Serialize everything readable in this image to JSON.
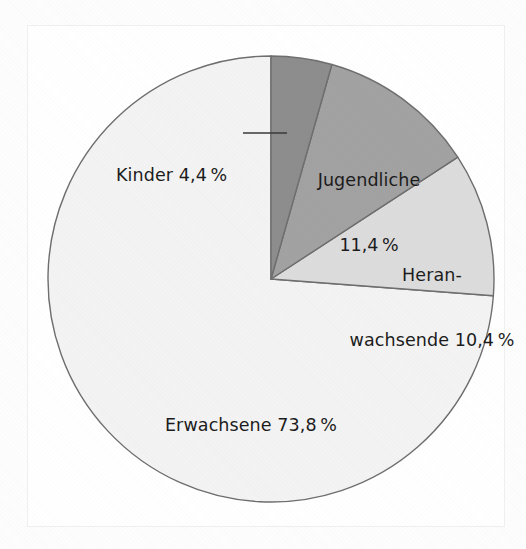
{
  "chart_data": {
    "type": "pie",
    "title": "",
    "subtitle": "",
    "xlabel": "",
    "ylabel": "",
    "legend_position": "none",
    "grid": false,
    "units": "percent",
    "decimal_separator": ",",
    "start_angle_deg": 0,
    "direction": "clockwise",
    "categories": [
      "Kinder",
      "Jugendliche",
      "Heranwachsende",
      "Erwachsene"
    ],
    "values": [
      4.4,
      11.4,
      10.4,
      73.8
    ],
    "colors": [
      "#8d8d8d",
      "#a2a2a2",
      "#dcdcdc",
      "#f3f3f3"
    ],
    "slices": [
      {
        "name": "Kinder",
        "value": 4.4,
        "value_text": "4,4 %",
        "label_text": "Kinder 4,4 %",
        "color": "#8d8d8d",
        "label_placement": "outside-left",
        "has_leader_line": true,
        "start_angle_deg": 0,
        "end_angle_deg": 15.84
      },
      {
        "name": "Jugendliche",
        "value": 11.4,
        "value_text": "11,4 %",
        "label_line1": "Jugendliche",
        "label_line2": "11,4 %",
        "color": "#a2a2a2",
        "label_placement": "inside",
        "has_leader_line": false,
        "start_angle_deg": 15.84,
        "end_angle_deg": 56.88
      },
      {
        "name": "Heranwachsende",
        "value": 10.4,
        "value_text": "10,4 %",
        "label_line1": "Heran-",
        "label_line2": "wachsende 10,4 %",
        "color": "#dcdcdc",
        "label_placement": "inside",
        "has_leader_line": false,
        "start_angle_deg": 56.88,
        "end_angle_deg": 94.32
      },
      {
        "name": "Erwachsene",
        "value": 73.8,
        "value_text": "73,8 %",
        "label_text": "Erwachsene 73,8 %",
        "color": "#f3f3f3",
        "label_placement": "inside",
        "has_leader_line": false,
        "start_angle_deg": 94.32,
        "end_angle_deg": 360
      }
    ]
  },
  "figure": {
    "background_color": "#ffffff",
    "frame_color": "#f0f0f0",
    "outline_color": "#6e6e6e",
    "text_color": "#1c1c1c",
    "center_x": 271,
    "center_y": 279,
    "radius": 223
  },
  "labels": {
    "kinder": "Kinder 4,4 %",
    "jugendliche_line1": "Jugendliche",
    "jugendliche_line2": "11,4 %",
    "heranwachsende_line1": "Heran-",
    "heranwachsende_line2": "wachsende 10,4 %",
    "erwachsene": "Erwachsene 73,8 %"
  }
}
